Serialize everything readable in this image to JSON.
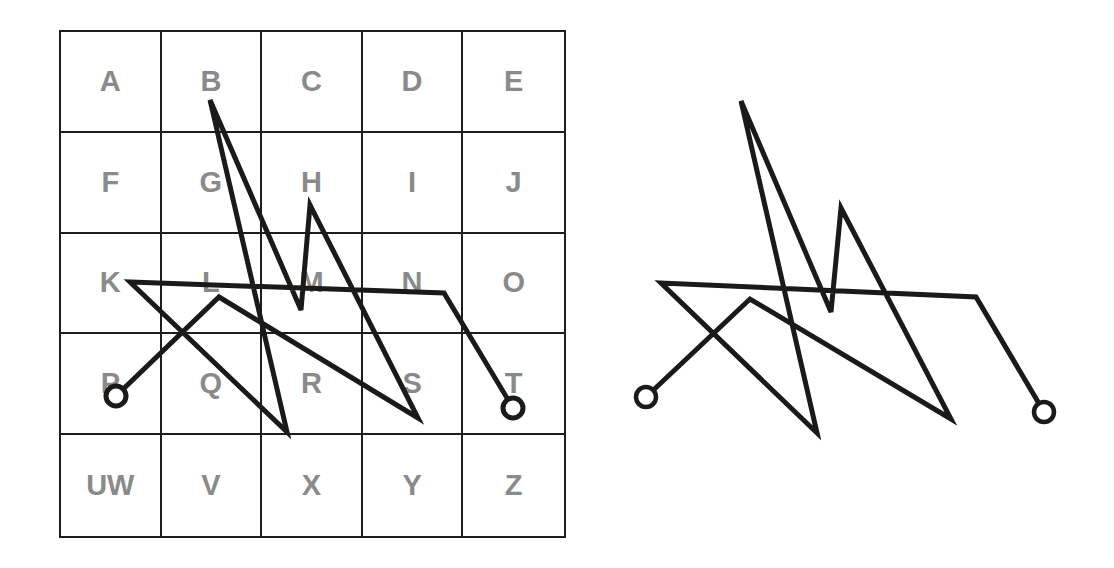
{
  "diagram": {
    "type": "name-sigil",
    "grid": {
      "rows": 5,
      "cols": 5,
      "cells": [
        "A",
        "B",
        "C",
        "D",
        "E",
        "F",
        "G",
        "H",
        "I",
        "J",
        "K",
        "L",
        "M",
        "N",
        "O",
        "P",
        "Q",
        "R",
        "S",
        "T",
        "UW",
        "V",
        "X",
        "Y",
        "Z"
      ],
      "letter_color": "#8a8a8a",
      "line_color": "#1e1e1e"
    },
    "path": {
      "stroke_color": "#1a1a1a",
      "letter_sequence": [
        "P",
        "L",
        "S",
        "H",
        "M",
        "B",
        "R",
        "K",
        "N",
        "T"
      ],
      "start_marker": "circle",
      "end_marker": "circle",
      "grid_points": [
        [
          116,
          396
        ],
        [
          219,
          297
        ],
        [
          418,
          418
        ],
        [
          310,
          205
        ],
        [
          301,
          310
        ],
        [
          210,
          100
        ],
        [
          287,
          432
        ],
        [
          130,
          282
        ],
        [
          444,
          293
        ],
        [
          513,
          408
        ]
      ],
      "sigil_points": [
        [
          646,
          397
        ],
        [
          750,
          299
        ],
        [
          951,
          419
        ],
        [
          841,
          208
        ],
        [
          831,
          312
        ],
        [
          741,
          101
        ],
        [
          817,
          433
        ],
        [
          661,
          283
        ],
        [
          976,
          297
        ],
        [
          1044,
          412
        ]
      ]
    }
  }
}
